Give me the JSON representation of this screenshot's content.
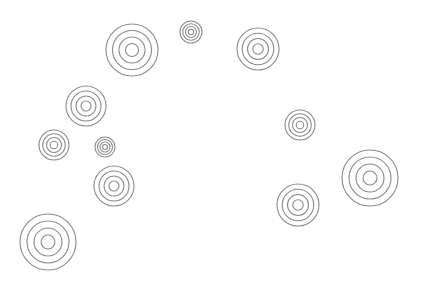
{
  "canvas": {
    "width": 421,
    "height": 286,
    "background": "#ffffff",
    "ring_color": "#8a8a8a",
    "rings_per_target": 4
  },
  "targets": [
    {
      "id": 1,
      "cx": 132,
      "cy": 50,
      "r": 26
    },
    {
      "id": 2,
      "cx": 191,
      "cy": 32,
      "r": 11
    },
    {
      "id": 3,
      "cx": 258,
      "cy": 49,
      "r": 21
    },
    {
      "id": 4,
      "cx": 86,
      "cy": 106,
      "r": 20
    },
    {
      "id": 5,
      "cx": 54,
      "cy": 145,
      "r": 15
    },
    {
      "id": 6,
      "cx": 105,
      "cy": 147,
      "r": 10
    },
    {
      "id": 7,
      "cx": 114,
      "cy": 186,
      "r": 20
    },
    {
      "id": 8,
      "cx": 300,
      "cy": 125,
      "r": 15
    },
    {
      "id": 9,
      "cx": 370,
      "cy": 178,
      "r": 28
    },
    {
      "id": 10,
      "cx": 298,
      "cy": 205,
      "r": 21
    },
    {
      "id": 11,
      "cx": 48,
      "cy": 242,
      "r": 28
    }
  ]
}
